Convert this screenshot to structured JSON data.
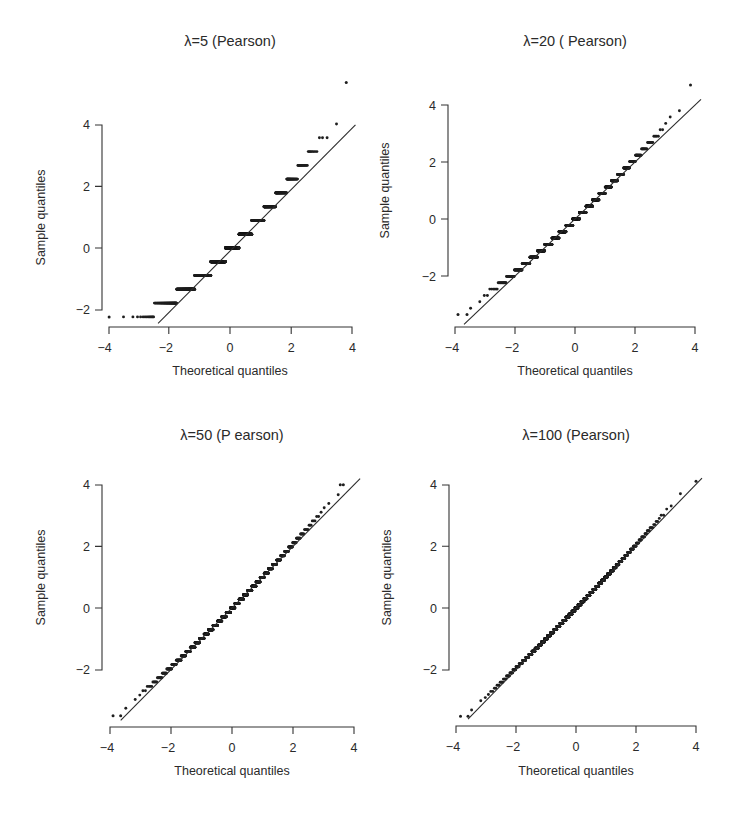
{
  "figure": {
    "layout": "2x2 grid of normal Q-Q plots",
    "ink_color": "#1e1e1e",
    "background": "#ffffff"
  },
  "chart_data": [
    {
      "type": "scatter",
      "subtype": "qq-plot",
      "title": "λ=5 (Pearson)",
      "lambda": 5,
      "residual_type": "Pearson",
      "xlabel": "Theoretical quantiles",
      "ylabel": "Sample quantiles",
      "xticks": [
        "-4",
        "-2",
        "0",
        "2",
        "4"
      ],
      "yticks": [
        "-2",
        "0",
        "2",
        "4"
      ],
      "xlim": [
        -4,
        4
      ],
      "ylim_ticks": [
        -2,
        4
      ],
      "reference_line": {
        "slope": 1,
        "intercept": 0,
        "from": [
          -2.35,
          -2.45
        ],
        "to": [
          4.1,
          4.0
        ]
      },
      "steps": [
        {
          "sample_quantile": -2.24,
          "x_range": [
            -4.0,
            -2.6
          ],
          "note": "k=0 (isolated dots at far left)"
        },
        {
          "sample_quantile": -1.79,
          "x_range": [
            -2.6,
            -1.75
          ]
        },
        {
          "sample_quantile": -1.34,
          "x_range": [
            -1.75,
            -1.1
          ]
        },
        {
          "sample_quantile": -0.89,
          "x_range": [
            -1.1,
            -0.6
          ]
        },
        {
          "sample_quantile": -0.45,
          "x_range": [
            -0.6,
            -0.1
          ]
        },
        {
          "sample_quantile": 0.0,
          "x_range": [
            -0.1,
            0.35
          ]
        },
        {
          "sample_quantile": 0.45,
          "x_range": [
            0.35,
            0.8
          ]
        },
        {
          "sample_quantile": 0.89,
          "x_range": [
            0.8,
            1.2
          ]
        },
        {
          "sample_quantile": 1.34,
          "x_range": [
            1.2,
            1.6
          ]
        },
        {
          "sample_quantile": 1.79,
          "x_range": [
            1.6,
            1.95
          ]
        },
        {
          "sample_quantile": 2.24,
          "x_range": [
            1.95,
            2.25
          ]
        },
        {
          "sample_quantile": 2.68,
          "x_range": [
            2.25,
            2.55
          ]
        },
        {
          "sample_quantile": 3.13,
          "x_range": [
            2.55,
            2.8
          ]
        },
        {
          "sample_quantile": 3.58,
          "x_range": [
            2.8,
            3.15
          ]
        },
        {
          "sample_quantile": 4.02,
          "x_range": [
            3.25,
            3.4
          ]
        },
        {
          "sample_quantile": 4.47,
          "x_range": [
            3.45,
            3.6
          ]
        },
        {
          "sample_quantile": 5.37,
          "x_range": [
            3.8,
            3.8
          ]
        }
      ]
    },
    {
      "type": "scatter",
      "subtype": "qq-plot",
      "title": "λ=20 ( Pearson)",
      "lambda": 20,
      "residual_type": "Pearson",
      "xlabel": "Theoretical quantiles",
      "ylabel": "Sample quantiles",
      "xticks": [
        "-4",
        "-2",
        "0",
        "2",
        "4"
      ],
      "yticks": [
        "-2",
        "0",
        "2",
        "4"
      ],
      "xlim": [
        -4,
        4
      ],
      "ylim_ticks": [
        -2,
        4
      ],
      "reference_line": {
        "slope": 1,
        "intercept": 0,
        "from": [
          -3.7,
          -3.7
        ],
        "to": [
          4.2,
          4.2
        ]
      },
      "step_size": 0.2236,
      "sample_range": [
        -3.35,
        4.7
      ],
      "low_outliers": [
        [
          -3.9,
          -3.35
        ],
        [
          -3.6,
          -3.35
        ]
      ],
      "high_outliers": [
        [
          3.85,
          4.7
        ]
      ]
    },
    {
      "type": "scatter",
      "subtype": "qq-plot",
      "title": "λ=50 (P earson)",
      "lambda": 50,
      "residual_type": "Pearson",
      "xlabel": "Theoretical quantiles",
      "ylabel": "Sample quantiles",
      "xticks": [
        "-4",
        "-2",
        "0",
        "2",
        "4"
      ],
      "yticks": [
        "-2",
        "0",
        "2",
        "4"
      ],
      "xlim": [
        -4,
        4
      ],
      "ylim_ticks": [
        -2,
        4
      ],
      "reference_line": {
        "slope": 1,
        "intercept": 0,
        "from": [
          -3.65,
          -3.65
        ],
        "to": [
          4.2,
          4.2
        ]
      },
      "step_size": 0.1414,
      "sample_range": [
        -3.54,
        4.0
      ],
      "low_outliers": [
        [
          -3.9,
          -3.5
        ],
        [
          -3.65,
          -3.5
        ]
      ],
      "high_outliers": [
        [
          3.55,
          4.0
        ],
        [
          3.65,
          4.0
        ]
      ]
    },
    {
      "type": "scatter",
      "subtype": "qq-plot",
      "title": "λ=100 (Pearson)",
      "lambda": 100,
      "residual_type": "Pearson",
      "xlabel": "Theoretical quantiles",
      "ylabel": "Sample quantiles",
      "xticks": [
        "-4",
        "-2",
        "0",
        "2",
        "4"
      ],
      "yticks": [
        "-2",
        "0",
        "2",
        "4"
      ],
      "xlim": [
        -4,
        4
      ],
      "ylim_ticks": [
        -2,
        4
      ],
      "reference_line": {
        "slope": 1,
        "intercept": 0,
        "from": [
          -3.6,
          -3.6
        ],
        "to": [
          4.2,
          4.2
        ]
      },
      "step_size": 0.1,
      "sample_range": [
        -3.5,
        4.1
      ],
      "low_outliers": [
        [
          -3.85,
          -3.5
        ],
        [
          -3.6,
          -3.5
        ]
      ],
      "high_outliers": [
        [
          4.0,
          4.1
        ]
      ]
    }
  ],
  "panels": [
    {
      "title": "λ=5 (Pearson)",
      "xlabel": "Theoretical quantiles",
      "ylabel": "Sample quantiles",
      "xticks": [
        "−4",
        "−2",
        "0",
        "2",
        "4"
      ],
      "yticks": [
        "−2",
        "0",
        "2",
        "4"
      ]
    },
    {
      "title": "λ=20 ( Pearson)",
      "xlabel": "Theoretical quantiles",
      "ylabel": "Sample quantiles",
      "xticks": [
        "−4",
        "−2",
        "0",
        "2",
        "4"
      ],
      "yticks": [
        "−2",
        "0",
        "2",
        "4"
      ]
    },
    {
      "title": "λ=50 (P earson)",
      "xlabel": "Theoretical quantiles",
      "ylabel": "Sample quantiles",
      "xticks": [
        "−4",
        "−2",
        "0",
        "2",
        "4"
      ],
      "yticks": [
        "−2",
        "0",
        "2",
        "4"
      ]
    },
    {
      "title": "λ=100 (Pearson)",
      "xlabel": "Theoretical quantiles",
      "ylabel": "Sample quantiles",
      "xticks": [
        "−4",
        "−2",
        "0",
        "2",
        "4"
      ],
      "yticks": [
        "−2",
        "0",
        "2",
        "4"
      ]
    }
  ],
  "geometry": [
    {
      "x0": 230,
      "xs": 30.6,
      "y0": 248,
      "ys": 30.8,
      "yaxis_x": 102,
      "xaxis_y": 327,
      "ytop": 125,
      "ybot": 310,
      "xleft": 109,
      "xright": 352,
      "title_y": 46,
      "xlabel_y": 375,
      "ylabel_x": 45
    },
    {
      "x0": 575,
      "xs": 30.0,
      "y0": 219,
      "ys": 28.5,
      "yaxis_x": 448,
      "xaxis_y": 327,
      "ytop": 105,
      "ybot": 276,
      "xleft": 455,
      "xright": 695,
      "title_y": 46,
      "xlabel_y": 375,
      "ylabel_x": 389
    },
    {
      "x0": 232,
      "xs": 30.5,
      "y0": 608,
      "ys": 30.8,
      "yaxis_x": 102,
      "xaxis_y": 727,
      "ytop": 485,
      "ybot": 670,
      "xleft": 110,
      "xright": 354,
      "title_y": 440,
      "xlabel_y": 775,
      "ylabel_x": 45
    },
    {
      "x0": 576,
      "xs": 30.0,
      "y0": 608,
      "ys": 30.9,
      "yaxis_x": 449,
      "xaxis_y": 726,
      "ytop": 485,
      "ybot": 670,
      "xleft": 456,
      "xright": 696,
      "title_y": 440,
      "xlabel_y": 775,
      "ylabel_x": 391
    }
  ]
}
